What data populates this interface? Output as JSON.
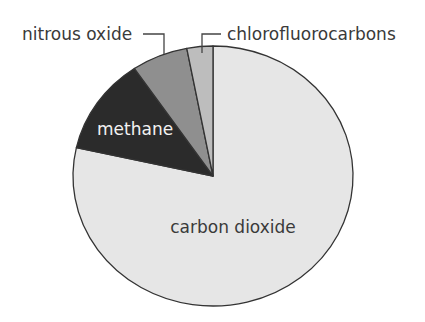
{
  "chart_data": {
    "type": "pie",
    "title": "",
    "center": [
      213,
      176
    ],
    "radius": [
      140,
      130
    ],
    "start_angle_deg": 0,
    "direction": "clockwise",
    "slices": [
      {
        "label": "carbon dioxide",
        "value": 78.5,
        "color": "#e6e6e6"
      },
      {
        "label": "methane",
        "value": 12.0,
        "color": "#2b2b2b"
      },
      {
        "label": "nitrous oxide",
        "value": 6.5,
        "color": "#8f8f8f"
      },
      {
        "label": "chlorofluorocarbons",
        "value": 3.0,
        "color": "#bdbdbd"
      }
    ],
    "outline_color": "#333333",
    "legend": "none (direct labels with leader lines)"
  },
  "labels": {
    "co2": "carbon dioxide",
    "methane": "methane",
    "n2o": "nitrous oxide",
    "cfc": "chlorofluorocarbons"
  }
}
